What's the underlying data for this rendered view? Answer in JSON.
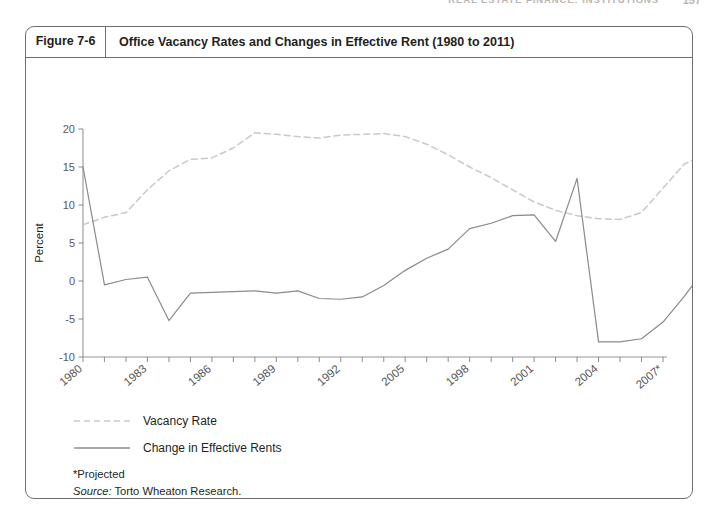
{
  "running_head": {
    "text": "REAL ESTATE FINANCE: INSTITUTIONS",
    "page": "157"
  },
  "figure": {
    "number_label": "Figure 7-6",
    "title": "Office Vacancy Rates and Changes in Effective Rent (1980 to 2011)"
  },
  "legend": {
    "items": [
      {
        "label": "Vacancy Rate",
        "style": "dashed",
        "color": "#c9c9c9"
      },
      {
        "label": "Change in Effective Rents",
        "style": "solid",
        "color": "#8a8a8a"
      }
    ]
  },
  "notes": {
    "projected": "*Projected",
    "source_label": "Source:",
    "source_text": " Torto Wheaton Research.",
    "note_label": "Note:",
    "note_text": " Net absorption equals square feet by 1,000."
  },
  "chart_data": {
    "type": "line",
    "title": "Office Vacancy Rates and Changes in Effective Rent (1980 to 2011)",
    "xlabel": "",
    "ylabel": "Percent",
    "ylim": [
      -10,
      20
    ],
    "ytick_values": [
      -10,
      -5,
      0,
      5,
      10,
      15,
      20
    ],
    "ytick_labels": [
      "-10",
      "-5",
      "0",
      "5",
      "10",
      "15",
      "20"
    ],
    "grid": false,
    "legend_position": "below-left",
    "x_tick_count": 27,
    "x_labeled_ticks": [
      {
        "index": 0,
        "label": "1980"
      },
      {
        "index": 3,
        "label": "1983"
      },
      {
        "index": 6,
        "label": "1986"
      },
      {
        "index": 9,
        "label": "1989"
      },
      {
        "index": 12,
        "label": "1992"
      },
      {
        "index": 15,
        "label": "2005"
      },
      {
        "index": 18,
        "label": "1998"
      },
      {
        "index": 21,
        "label": "2001"
      },
      {
        "index": 24,
        "label": "2004"
      },
      {
        "index": 27,
        "label": "2007*"
      },
      {
        "index": 30,
        "label": "2010*"
      },
      {
        "index": 31,
        "label": "2011*"
      }
    ],
    "series": [
      {
        "name": "Vacancy Rate",
        "style": "dashed",
        "color": "#c9c9c9",
        "values": [
          7.4,
          8.4,
          9.0,
          12.0,
          14.5,
          16.0,
          16.2,
          17.5,
          19.5,
          19.3,
          19.0,
          18.8,
          19.2,
          19.3,
          19.4,
          19.0,
          18.0,
          16.6,
          15.0,
          13.6,
          12.0,
          10.4,
          9.3,
          8.6,
          8.2,
          8.1,
          9.0,
          12.2,
          15.4,
          16.7,
          17.2,
          16.8,
          15.8,
          14.6,
          13.4,
          13.2,
          12.8,
          12.2,
          11.7,
          11.3,
          10.9,
          10.6
        ]
      },
      {
        "name": "Change in Effective Rents",
        "style": "solid",
        "color": "#8a8a8a",
        "values": [
          15.0,
          -0.5,
          0.2,
          0.5,
          -5.2,
          -1.6,
          -1.5,
          -1.4,
          -1.3,
          -1.6,
          -1.3,
          -2.3,
          -2.4,
          -2.1,
          -0.6,
          1.4,
          3.0,
          4.2,
          6.9,
          7.6,
          8.6,
          8.7,
          5.2,
          13.5,
          -8.0,
          -8.0,
          -7.6,
          -5.4,
          -2.0,
          1.8,
          5.4,
          9.8,
          5.2,
          5.0,
          4.8,
          4.6,
          4.4,
          4.2,
          4.0,
          4.0,
          4.0,
          4.0
        ]
      }
    ]
  }
}
